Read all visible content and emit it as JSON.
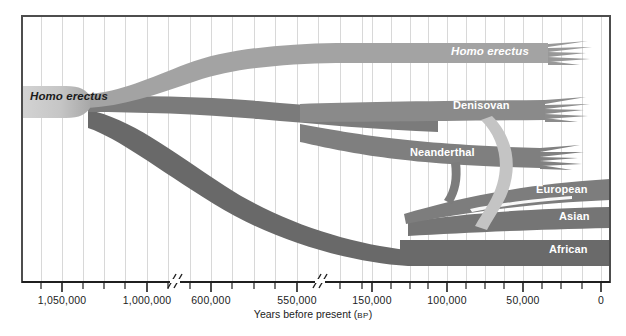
{
  "figure": {
    "type": "phylogenetic-admixture-diagram",
    "title": "",
    "background_color": "#ffffff",
    "plot_frame_color": "#4a4a4a",
    "gridline_color": "#d7d7d7"
  },
  "axis": {
    "title_text": "Years before present (",
    "title_suffix": "BP",
    "title_close": ")",
    "label": "Years before present (BP)",
    "direction": "right-to-left-decreasing",
    "break_marks": 2,
    "tick_labels": [
      {
        "text": "1,050,000",
        "x": 62
      },
      {
        "text": "1,000,000",
        "x": 147
      },
      {
        "text": "600,000",
        "x": 211
      },
      {
        "text": "550,000",
        "x": 297
      },
      {
        "text": "150,000",
        "x": 372
      },
      {
        "text": "100,000",
        "x": 447
      },
      {
        "text": "50,000",
        "x": 523
      },
      {
        "text": "0",
        "x": 601
      }
    ],
    "major_tick_x": [
      62,
      147,
      211,
      297,
      372,
      447,
      523,
      601
    ],
    "break_x": [
      172,
      317
    ]
  },
  "colors": {
    "band_light": "#cfcfcf",
    "band_mid": "#9a9a9a",
    "band_dark": "#6e6e6e",
    "band_darkest": "#5f5f5f",
    "gene_flow_light": "#c2c2c2",
    "gene_flow_dark": "#7a7a7a",
    "label_dark": "#1b1b1b",
    "label_light": "#ffffff"
  },
  "lineage_labels": {
    "root": {
      "text": "Homo erectus",
      "x": 30,
      "y": 98,
      "style": "bold-italic-dark"
    },
    "erectus_tip": {
      "text": "Homo erectus",
      "x": 451,
      "y": 50,
      "style": "bold-italic-white"
    },
    "denisovan": {
      "text": "Denisovan",
      "x": 453,
      "y": 104,
      "style": "bold-white"
    },
    "neanderthal": {
      "text": "Neanderthal",
      "x": 412,
      "y": 152,
      "style": "bold-white"
    },
    "european": {
      "text": "European",
      "x": 538,
      "y": 189,
      "style": "bold-white"
    },
    "asian": {
      "text": "Asian",
      "x": 560,
      "y": 215,
      "style": "bold-white"
    },
    "african": {
      "text": "African",
      "x": 551,
      "y": 248,
      "style": "bold-white"
    }
  },
  "gene_flow": [
    {
      "from": "Denisovan",
      "to": "Asian",
      "shade": "light"
    },
    {
      "from": "Neanderthal",
      "to": "European-Asian",
      "shade": "dark"
    }
  ]
}
